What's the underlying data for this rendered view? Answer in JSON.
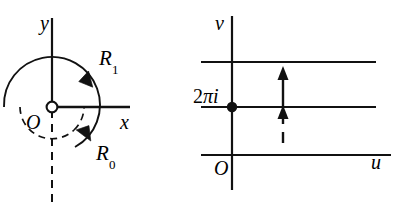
{
  "figure": {
    "width": 402,
    "height": 212,
    "background": "#ffffff",
    "ink": "#111111"
  },
  "panels": [
    {
      "id": "z-plane",
      "name": "left-panel",
      "axes": {
        "vertical_label": "y",
        "horizontal_label": "x",
        "origin_label": "O",
        "origin_marker": "open-circle"
      },
      "curves": [
        {
          "name": "outer-arc",
          "label": "R",
          "subscript": "1",
          "style": "solid",
          "radius_px": 48,
          "direction": "clockwise",
          "arrow": "at-45-degrees-upper-right"
        },
        {
          "name": "inner-arc",
          "label": "R",
          "subscript": "0",
          "style": "dashed",
          "radius_px": 32,
          "direction": "counter-clockwise",
          "arrow": "at-lower-right-pointing-up-left"
        }
      ],
      "branch_cut": {
        "name": "branch-cut",
        "style": "dashed",
        "orientation": "vertical-downward-from-origin"
      }
    },
    {
      "id": "w-plane",
      "name": "right-panel",
      "axes": {
        "vertical_label": "v",
        "horizontal_label": "u",
        "origin_label": "O"
      },
      "marked_point": {
        "label": "2πi",
        "label_prefix": "2",
        "label_pi": "π",
        "label_i": "i",
        "marker": "filled-dot"
      },
      "horizontal_lines": [
        {
          "name": "upper-image-line",
          "style": "solid"
        },
        {
          "name": "middle-image-line",
          "style": "solid"
        },
        {
          "name": "lower-image-line",
          "style": "solid"
        }
      ],
      "arrows": [
        {
          "name": "long-up-arrow",
          "style": "solid",
          "direction": "up"
        },
        {
          "name": "short-up-arrow",
          "style": "solid",
          "direction": "up"
        },
        {
          "name": "dash-tail",
          "style": "dashed",
          "direction": "up"
        }
      ]
    }
  ]
}
